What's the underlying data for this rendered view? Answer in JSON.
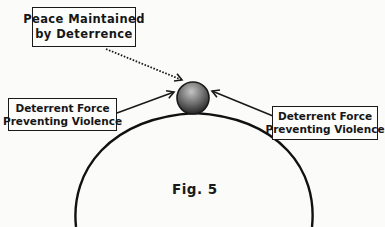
{
  "diagram": {
    "type": "concept-diagram",
    "callouts": {
      "peace": {
        "line1": "Peace Maintained",
        "line2": "by Deterrence"
      },
      "left_force": {
        "line1": "Deterrent Force",
        "line2": "Preventing Violence"
      },
      "right_force": {
        "line1": "Deterrent Force",
        "line2": "Preventing Violence"
      }
    },
    "figure_label": "Fig. 5",
    "elements": {
      "ball": "sphere balanced on top of hill",
      "hill": "arched curve",
      "arrows": [
        "dotted arrow from peace box to ball",
        "solid arrow from left box to ball",
        "solid arrow from right box to ball"
      ]
    },
    "colors": {
      "ink": "#1a1a1a",
      "ball_light": "#b9b9b9",
      "ball_dark": "#2c2c2c",
      "paper": "#fbfbfa"
    }
  }
}
